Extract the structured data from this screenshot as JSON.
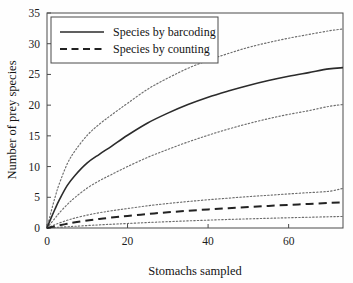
{
  "chart_data": {
    "type": "line",
    "title": "",
    "xlabel": "Stomachs sampled",
    "ylabel": "Number of prey species",
    "xlim": [
      0,
      73.5
    ],
    "ylim": [
      0,
      35
    ],
    "xticks": [
      0,
      20,
      40,
      60
    ],
    "yticks": [
      0,
      5,
      10,
      15,
      20,
      25,
      30,
      35
    ],
    "grid": false,
    "legend_position": "top-left",
    "legend_entries": [
      {
        "label": "Species by barcoding",
        "style": "solid"
      },
      {
        "label": "Species by counting",
        "style": "dashed"
      }
    ],
    "x": [
      0,
      1,
      2,
      3,
      5,
      7,
      10,
      13,
      16,
      20,
      25,
      30,
      35,
      40,
      45,
      50,
      55,
      60,
      65,
      70,
      73.5
    ],
    "series": [
      {
        "name": "Species by barcoding",
        "style": "solid",
        "values": [
          0,
          1.6,
          3.1,
          4.5,
          6.9,
          8.6,
          10.6,
          12.0,
          13.3,
          15.1,
          17.1,
          18.7,
          20.1,
          21.3,
          22.3,
          23.2,
          24.0,
          24.7,
          25.3,
          25.9,
          26.1
        ]
      },
      {
        "name": "Species by barcoding upper CI",
        "style": "dotted",
        "values": [
          0,
          2.6,
          5.0,
          7.1,
          10.4,
          12.6,
          15.1,
          16.9,
          18.4,
          20.3,
          22.6,
          24.4,
          26.0,
          27.3,
          28.4,
          29.4,
          30.2,
          30.9,
          31.5,
          32.1,
          32.4
        ]
      },
      {
        "name": "Species by barcoding lower CI",
        "style": "dotted",
        "values": [
          0,
          0.8,
          1.6,
          2.4,
          3.8,
          5.0,
          6.5,
          7.7,
          8.7,
          10.0,
          11.5,
          12.8,
          14.0,
          15.1,
          16.1,
          17.0,
          17.8,
          18.5,
          19.1,
          19.8,
          20.1
        ]
      },
      {
        "name": "Species by counting",
        "style": "dashed",
        "values": [
          0,
          0.14,
          0.28,
          0.42,
          0.68,
          0.92,
          1.22,
          1.48,
          1.7,
          1.96,
          2.28,
          2.56,
          2.8,
          3.02,
          3.22,
          3.41,
          3.59,
          3.76,
          3.92,
          4.08,
          4.16
        ]
      },
      {
        "name": "Species by counting upper CI",
        "style": "dotted",
        "values": [
          0,
          0.28,
          0.55,
          0.8,
          1.25,
          1.63,
          2.1,
          2.48,
          2.8,
          3.17,
          3.62,
          3.99,
          4.31,
          4.6,
          4.86,
          5.1,
          5.33,
          5.55,
          5.76,
          5.97,
          6.45
        ]
      },
      {
        "name": "Species by counting lower CI",
        "style": "dotted",
        "values": [
          0,
          0.04,
          0.08,
          0.12,
          0.2,
          0.28,
          0.4,
          0.51,
          0.61,
          0.74,
          0.89,
          1.03,
          1.16,
          1.28,
          1.39,
          1.49,
          1.58,
          1.67,
          1.75,
          1.83,
          1.88
        ]
      }
    ]
  }
}
